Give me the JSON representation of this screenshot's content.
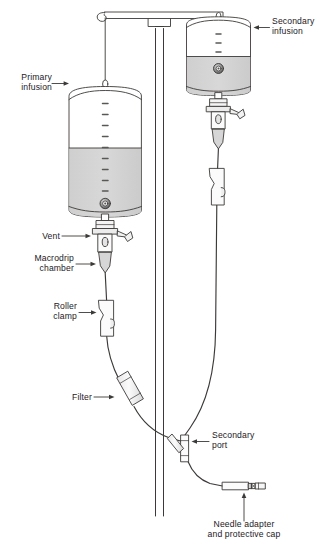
{
  "figure": {
    "type": "medical-illustration",
    "background_color": "#ffffff",
    "line_color": "#3c3a38",
    "fluid_color": "#d4d4d4",
    "text_color": "#23201e"
  },
  "labels": {
    "primary_infusion": "Primary\ninfusion",
    "secondary_infusion": "Secondary\ninfusion",
    "vent": "Vent",
    "macrodrip_chamber": "Macrodrip\nchamber",
    "roller_clamp": "Roller\nclamp",
    "filter": "Filter",
    "secondary_port": "Secondary\nport",
    "needle_adapter": "Needle adapter\nand protective cap"
  },
  "parts": [
    {
      "id": "primary-bag",
      "name": "Primary infusion bag",
      "fill_level": "about two-thirds full",
      "graduation_marks": 11
    },
    {
      "id": "secondary-bag",
      "name": "Secondary infusion bag",
      "fill_level": "about half full",
      "graduation_marks": 4
    },
    {
      "id": "iv-pole",
      "name": "IV pole with horizontal hanger bar"
    },
    {
      "id": "primary-hook",
      "name": "S hook hanging primary bag"
    },
    {
      "id": "primary-spike",
      "name": "Spike and vent assembly"
    },
    {
      "id": "primary-drip-chamber",
      "name": "Macrodrip chamber"
    },
    {
      "id": "roller-clamp",
      "name": "Roller clamp on primary tubing"
    },
    {
      "id": "inline-filter",
      "name": "Inline filter"
    },
    {
      "id": "secondary-port",
      "name": "Secondary Y port"
    },
    {
      "id": "needle-adapter",
      "name": "Needle adapter and protective cap"
    },
    {
      "id": "secondary-clamp",
      "name": "Roller clamp on secondary tubing"
    }
  ]
}
